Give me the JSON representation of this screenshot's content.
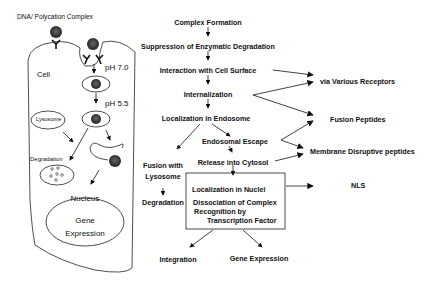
{
  "left_panel": {
    "title": "DNA/ Polycation Complex",
    "cell_label": "Cell",
    "ph_1": "pH 7.0",
    "ph_2": "pH 5.5",
    "lysosome": "Lysosome",
    "degradation": "Degradation",
    "nucleus": "Nucleus",
    "gene": "Gene",
    "expression": "Expression"
  },
  "flow": {
    "complex_formation": "Complex Formation",
    "suppression": "Suppression of Enzymatic Degradation",
    "interaction": "Interaction with Cell Surface",
    "internalization": "Internalization",
    "localization_endosome": "Localization in Endosome",
    "endosomal_escape": "Endosomal  Escape",
    "fusion_with": "Fusion with",
    "lysosome": "Lysosome",
    "release": "Release into Cytosol",
    "degradation": "Degradation",
    "box_line1": "Localization in Nuclei",
    "box_line2": "Dissociation of Complex",
    "box_line3": "Recognition by",
    "box_line4": "Transcription Factor",
    "integration": "Integration",
    "gene_expression": "Gene Expression"
  },
  "mechanisms": {
    "receptors": "via Various Receptors",
    "fusion_peptides": "Fusion Peptides",
    "membrane_disruptive": "Membrane Disruptive peptides",
    "nls": "NLS"
  }
}
